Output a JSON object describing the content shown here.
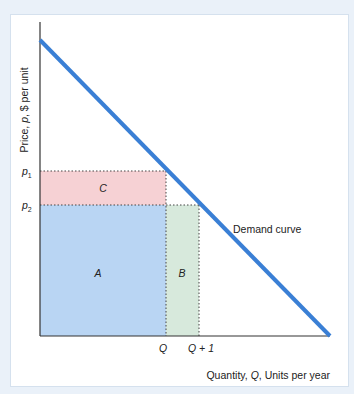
{
  "diagram": {
    "y_axis_label": "Price, p, $ per unit",
    "y_axis_label_parts": {
      "pre": "Price, ",
      "var": "p",
      "post": ", $ per unit"
    },
    "x_axis_label_parts": {
      "pre": "Quantity, ",
      "var": "Q",
      "post": ", Units per year"
    },
    "x_axis_label": "Quantity, Q, Units per year",
    "curve_label": "Demand curve",
    "price_ticks": [
      {
        "base": "p",
        "sub": "1"
      },
      {
        "base": "p",
        "sub": "2"
      }
    ],
    "quantity_ticks": [
      "Q",
      "Q + 1"
    ],
    "areas": {
      "A": "A",
      "B": "B",
      "C": "C"
    },
    "colors": {
      "demand_line": "#3a7fd5",
      "area_A": "#b9d5f3",
      "area_B": "#d7e9dc",
      "area_C": "#f6d1d4",
      "axis": "#333333",
      "background": "#eaf1f9"
    }
  }
}
